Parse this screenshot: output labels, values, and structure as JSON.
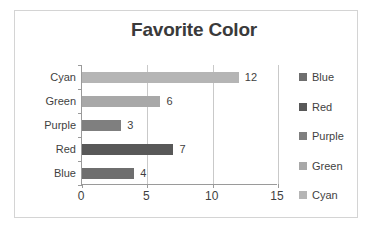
{
  "chart_data": {
    "type": "bar",
    "orientation": "horizontal",
    "title": "Favorite Color",
    "xlabel": "",
    "ylabel": "",
    "categories": [
      "Cyan",
      "Green",
      "Purple",
      "Red",
      "Blue"
    ],
    "values": [
      12,
      6,
      3,
      7,
      4
    ],
    "value_labels": [
      "12",
      "6",
      "3",
      "7",
      "4"
    ],
    "bar_colors": [
      "#b5b5b5",
      "#a8a8a8",
      "#7f7f7f",
      "#585858",
      "#6e6e6e"
    ],
    "xlim": [
      0,
      15
    ],
    "xticks": [
      0,
      5,
      10,
      15
    ],
    "xtick_labels": [
      "0",
      "5",
      "10",
      "15"
    ],
    "grid": "vertical",
    "legend_position": "right",
    "legend": [
      {
        "label": "Blue",
        "color": "#6e6e6e"
      },
      {
        "label": "Red",
        "color": "#585858"
      },
      {
        "label": "Purple",
        "color": "#7f7f7f"
      },
      {
        "label": "Green",
        "color": "#a8a8a8"
      },
      {
        "label": "Cyan",
        "color": "#b5b5b5"
      }
    ]
  },
  "colors": {
    "background": "#ffffff",
    "frame_border": "#d4d4d4",
    "axis_line": "#9a9a9a",
    "gridline": "#c9c9c9",
    "text": "#3f3f3f",
    "title_text": "#3a3a3a"
  }
}
